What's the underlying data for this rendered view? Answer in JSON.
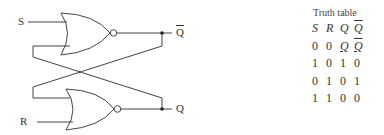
{
  "circuit": {
    "title": "SR latch (NOR gates)",
    "inputs": {
      "s_label": "S",
      "r_label": "R"
    },
    "outputs": {
      "qbar_label": "Q",
      "q_label": "Q"
    },
    "gates": [
      {
        "type": "NOR",
        "position": "top",
        "inputs": [
          "S",
          "Q"
        ],
        "output": "Q̄"
      },
      {
        "type": "NOR",
        "position": "bottom",
        "inputs": [
          "Q̄",
          "R"
        ],
        "output": "Q"
      }
    ],
    "line_color": "#444444"
  },
  "truth_table": {
    "title": "Truth table",
    "headers": [
      "S",
      "R",
      "Q",
      "Q"
    ],
    "header_overline": [
      false,
      false,
      false,
      true
    ],
    "rows": [
      {
        "cells": [
          "0",
          "0",
          "Q",
          "Q"
        ],
        "italic": [
          false,
          false,
          true,
          true
        ],
        "overline": [
          false,
          false,
          false,
          true
        ],
        "underline": [
          false,
          false,
          true,
          true
        ]
      },
      {
        "cells": [
          "1",
          "0",
          "1",
          "0"
        ]
      },
      {
        "cells": [
          "0",
          "1",
          "0",
          "1"
        ]
      },
      {
        "cells": [
          "1",
          "1",
          "0",
          "0"
        ]
      }
    ]
  }
}
